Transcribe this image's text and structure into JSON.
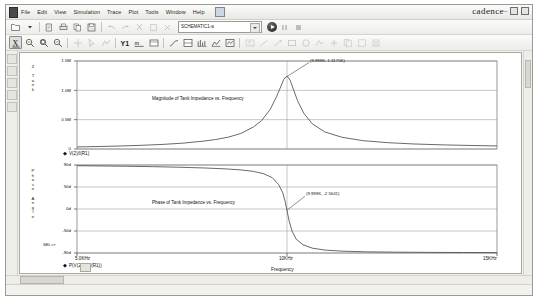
{
  "window": {
    "brand": "cadence",
    "minimize": "–",
    "restore": "□",
    "close": "✕"
  },
  "menu": {
    "items": [
      {
        "label": "File"
      },
      {
        "label": "Edit"
      },
      {
        "label": "View"
      },
      {
        "label": "Simulation"
      },
      {
        "label": "Trace"
      },
      {
        "label": "Plot"
      },
      {
        "label": "Tools"
      },
      {
        "label": "Window"
      },
      {
        "label": "Help"
      }
    ]
  },
  "toolbar1": {
    "icons": [
      {
        "name": "open-file-icon"
      },
      {
        "name": "open-dropdown-icon"
      },
      {
        "name": "print-preview-icon"
      },
      {
        "name": "print-icon"
      },
      {
        "name": "copy-icon"
      },
      {
        "name": "save-icon"
      },
      {
        "name": "undo-icon"
      },
      {
        "name": "redo-icon"
      },
      {
        "name": "cut-icon"
      },
      {
        "name": "paste-icon"
      },
      {
        "name": "delete-icon"
      }
    ],
    "profile_value": "SCHEMATIC1-a",
    "run_label": "Run",
    "after_icons": [
      {
        "name": "pause-icon"
      },
      {
        "name": "stop-icon"
      }
    ]
  },
  "toolbar2": {
    "icons": [
      {
        "name": "zoom-in-icon"
      },
      {
        "name": "zoom-out-icon"
      },
      {
        "name": "zoom-area-icon"
      },
      {
        "name": "zoom-fit-icon"
      },
      {
        "name": "pan-icon"
      },
      {
        "name": "cursor-icon"
      },
      {
        "name": "cursor-peak-icon"
      },
      {
        "name": "add-trace-y1-icon"
      },
      {
        "name": "eval-goal-icon"
      },
      {
        "name": "cursor-display-icon"
      },
      {
        "name": "toggle-x-axis-icon"
      },
      {
        "name": "log-x-icon"
      },
      {
        "name": "add-plot-icon"
      },
      {
        "name": "fourier-icon"
      },
      {
        "name": "performance-analysis-icon"
      },
      {
        "name": "cursor-trough-icon"
      },
      {
        "name": "label-text-icon"
      },
      {
        "name": "label-line-icon"
      },
      {
        "name": "label-arrow-icon"
      },
      {
        "name": "label-box-icon"
      },
      {
        "name": "label-circle-icon"
      },
      {
        "name": "label-poly-icon"
      },
      {
        "name": "label-mark-icon"
      },
      {
        "name": "copy-plot-icon"
      },
      {
        "name": "paste-plot-icon"
      },
      {
        "name": "delete-plot-icon"
      }
    ]
  },
  "left_rail": {
    "icons": [
      {
        "name": "simulation-output-icon"
      },
      {
        "name": "watch-icon"
      },
      {
        "name": "probe-cursor-icon"
      },
      {
        "name": "measurement-icon"
      },
      {
        "name": "marker-icon"
      }
    ]
  },
  "chart_data": [
    {
      "type": "line",
      "id": "magnitude-plot",
      "title": "Magnitude of Tank Impedance vs. Frequency",
      "xlabel": "",
      "ylabel": "Z Tank",
      "xticks": [
        "5.0KHz",
        "10KHz",
        "15KHz"
      ],
      "yticks": [
        "0",
        "0.5M",
        "1.0M",
        "1.5M"
      ],
      "ylim": [
        0,
        1600000
      ],
      "xlim": [
        5000,
        15000
      ],
      "grid": true,
      "legend": "V(2)/I(R1)",
      "legend_marker": "◆",
      "annotation": "(9.999K, 1.3175K)",
      "annotation_x": 9999,
      "annotation_y": 1317500,
      "series": [
        {
          "name": "V(2)/I(R1)",
          "x": [
            5000,
            5500,
            6000,
            6500,
            7000,
            7500,
            8000,
            8300,
            8600,
            8900,
            9200,
            9400,
            9600,
            9750,
            9850,
            9920,
            9970,
            9999,
            10030,
            10080,
            10150,
            10250,
            10400,
            10600,
            10900,
            11300,
            11800,
            12400,
            13000,
            13800,
            14500,
            15000
          ],
          "y": [
            38000,
            45000,
            54000,
            66000,
            82000,
            105000,
            142000,
            172000,
            215000,
            282000,
            400000,
            520000,
            720000,
            950000,
            1130000,
            1260000,
            1310000,
            1317500,
            1305000,
            1240000,
            1090000,
            880000,
            650000,
            460000,
            310000,
            215000,
            152000,
            115000,
            92000,
            73000,
            62000,
            56000
          ]
        }
      ]
    },
    {
      "type": "line",
      "id": "phase-plot",
      "title": "Phase of Tank Impedance vs. Frequency",
      "xlabel": "Frequency",
      "ylabel": "Phase Angle",
      "xticks": [
        "5.0KHz",
        "10KHz",
        "15KHz"
      ],
      "yticks": [
        "-90d",
        "-50d",
        "0d",
        "50d",
        "90d"
      ],
      "ylim": [
        -90,
        90
      ],
      "xlim": [
        5000,
        15000
      ],
      "grid": true,
      "legend": "P(V(2))-P(I(R1))",
      "legend_marker": "◆",
      "annotation": "(9.999K, -2.5641)",
      "annotation_x": 9999,
      "annotation_y": -2.5641,
      "select_marker": "SEL>>",
      "series": [
        {
          "name": "P(V(2))-P(I(R1))",
          "x": [
            5000,
            5600,
            6200,
            6800,
            7400,
            8000,
            8500,
            8900,
            9200,
            9450,
            9650,
            9800,
            9900,
            9960,
            9999,
            10050,
            10120,
            10220,
            10380,
            10600,
            10900,
            11300,
            11900,
            12600,
            13400,
            14200,
            15000
          ],
          "y": [
            88.5,
            88.0,
            87.4,
            86.6,
            85.5,
            84.0,
            82.2,
            80.0,
            77.0,
            72.0,
            64.0,
            50.0,
            33.0,
            14.0,
            -2.6,
            -24.0,
            -45.0,
            -62.0,
            -73.0,
            -80.0,
            -84.0,
            -86.2,
            -87.6,
            -88.3,
            -88.7,
            -89.0,
            -89.2
          ]
        }
      ]
    }
  ],
  "status": {
    "text": ""
  }
}
